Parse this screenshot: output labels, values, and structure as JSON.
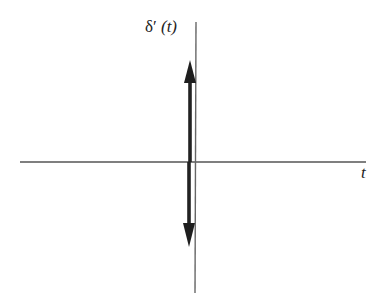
{
  "diagram": {
    "y_axis_label": {
      "function": "δ′",
      "argument": "(t)"
    },
    "x_axis_label": "t",
    "colors": {
      "axis": "#555555",
      "impulse": "#222222",
      "text": "#222222",
      "background": "#ffffff"
    },
    "elements": [
      {
        "kind": "axis",
        "name": "horizontal-axis",
        "x1": 20,
        "y1": 162,
        "x2": 366,
        "y2": 162
      },
      {
        "kind": "axis",
        "name": "vertical-axis",
        "x1": 196,
        "y1": 22,
        "x2": 195,
        "y2": 293
      },
      {
        "kind": "impulse",
        "name": "positive-impulse-arrow",
        "direction": "up",
        "x": 190,
        "from_y": 162,
        "to_y": 60
      },
      {
        "kind": "impulse",
        "name": "negative-impulse-arrow",
        "direction": "down",
        "x": 189,
        "from_y": 162,
        "to_y": 246
      }
    ]
  }
}
